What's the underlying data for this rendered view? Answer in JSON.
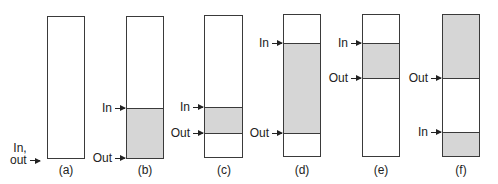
{
  "diagram": {
    "panels": [
      {
        "id": "a",
        "caption": "(a)",
        "box": {
          "left": 47,
          "top": 16,
          "width": 38,
          "height": 143
        },
        "shaded": [],
        "pointers": [
          {
            "label_lines": [
              "In,",
              "out"
            ],
            "y": 158
          }
        ]
      },
      {
        "id": "b",
        "caption": "(b)",
        "box": {
          "left": 126,
          "top": 16,
          "width": 38,
          "height": 143
        },
        "shaded": [
          {
            "from": 108,
            "to": 158
          }
        ],
        "pointers": [
          {
            "label": "In",
            "y": 108
          },
          {
            "label": "Out",
            "y": 158
          }
        ]
      },
      {
        "id": "c",
        "caption": "(c)",
        "box": {
          "left": 204,
          "top": 15,
          "width": 39,
          "height": 143
        },
        "shaded": [
          {
            "from": 107,
            "to": 133
          }
        ],
        "pointers": [
          {
            "label": "In",
            "y": 107
          },
          {
            "label": "Out",
            "y": 133
          }
        ]
      },
      {
        "id": "d",
        "caption": "(d)",
        "box": {
          "left": 283,
          "top": 14,
          "width": 38,
          "height": 143
        },
        "shaded": [
          {
            "from": 43,
            "to": 133
          }
        ],
        "pointers": [
          {
            "label": "In",
            "y": 43
          },
          {
            "label": "Out",
            "y": 133
          }
        ]
      },
      {
        "id": "e",
        "caption": "(e)",
        "box": {
          "left": 362,
          "top": 14,
          "width": 38,
          "height": 143
        },
        "shaded": [
          {
            "from": 43,
            "to": 78
          }
        ],
        "pointers": [
          {
            "label": "In",
            "y": 43
          },
          {
            "label": "Out",
            "y": 78
          }
        ]
      },
      {
        "id": "f",
        "caption": "(f)",
        "box": {
          "left": 442,
          "top": 14,
          "width": 38,
          "height": 143
        },
        "shaded": [
          {
            "from": 14,
            "to": 78
          },
          {
            "from": 132,
            "to": 157
          }
        ],
        "pointers": [
          {
            "label": "Out",
            "y": 78
          },
          {
            "label": "In",
            "y": 132
          }
        ]
      }
    ],
    "colors": {
      "stroke": "#3a3a3a",
      "shade": "#d6d6d6",
      "text": "#222222",
      "background": "#ffffff"
    }
  }
}
